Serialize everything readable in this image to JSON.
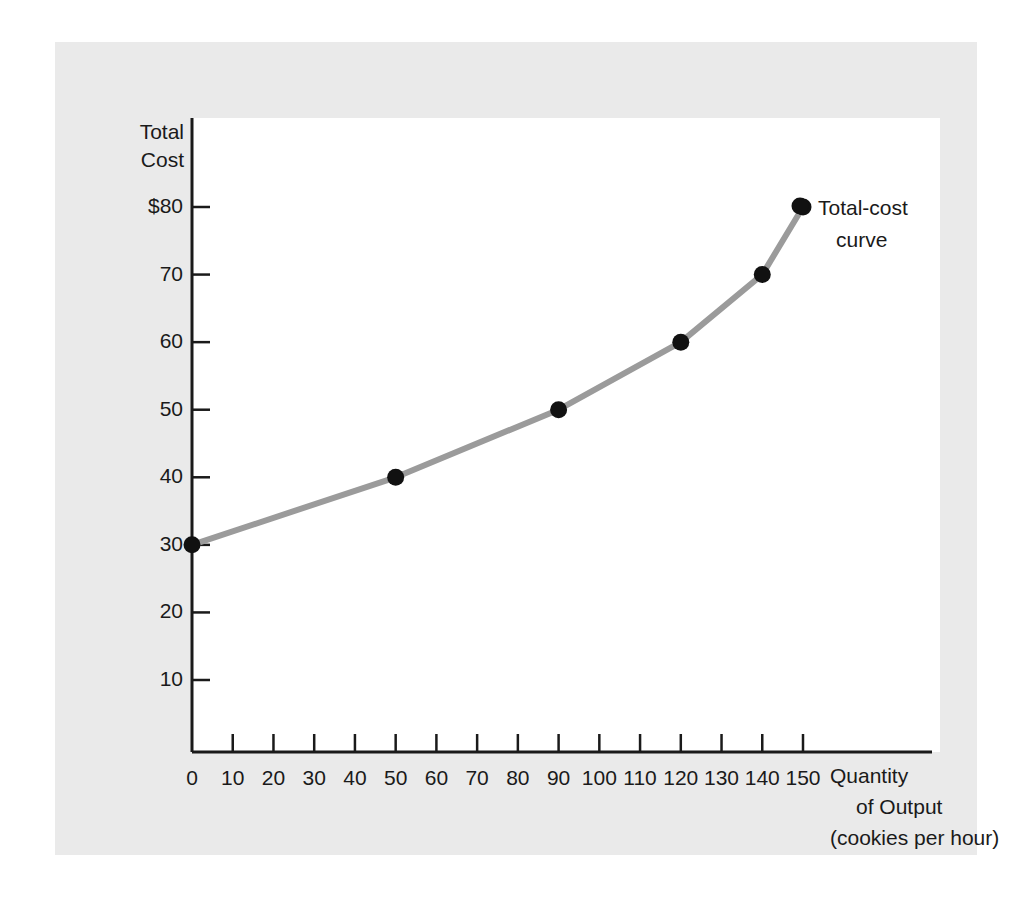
{
  "figure": {
    "panel_color": "#eaeaea",
    "plot_background": "#ffffff",
    "curve_color": "#9b9b9b",
    "marker_color": "#111111",
    "axis_color": "#1a1a1a"
  },
  "annotation": {
    "line1": "Total-cost",
    "line2": "curve"
  },
  "axis_titles": {
    "y_line1": "Total",
    "y_line2": "Cost",
    "x_line1": "Quantity",
    "x_line2": "of Output",
    "x_line3": "(cookies per hour)"
  },
  "chart_data": {
    "type": "line",
    "title": "",
    "subtitle": "",
    "xlabel": "Quantity of Output (cookies per hour)",
    "ylabel": "Total Cost",
    "xlim": [
      0,
      150
    ],
    "ylim": [
      0,
      85
    ],
    "grid": false,
    "legend": "inline-annotation",
    "legend_position": "right-of-last-point",
    "xticks": [
      0,
      10,
      20,
      30,
      40,
      50,
      60,
      70,
      80,
      90,
      100,
      110,
      120,
      130,
      140,
      150
    ],
    "xticklabels": [
      "0",
      "10",
      "20",
      "30",
      "40",
      "50",
      "60",
      "70",
      "80",
      "90",
      "100",
      "110",
      "120",
      "130",
      "140",
      "150"
    ],
    "yticks": [
      10,
      20,
      30,
      40,
      50,
      60,
      70,
      80
    ],
    "yticklabels": [
      "10",
      "20",
      "30",
      "40",
      "50",
      "60",
      "70",
      "$80"
    ],
    "series": [
      {
        "name": "Total-cost curve",
        "x": [
          0,
          50,
          90,
          120,
          140,
          150
        ],
        "values": [
          30,
          40,
          50,
          60,
          70,
          80
        ],
        "marker": "circle",
        "line_color": "#9b9b9b",
        "marker_color": "#111111"
      }
    ],
    "annotations": [
      {
        "text": "Total-cost curve",
        "x": 150,
        "y": 80
      }
    ]
  }
}
